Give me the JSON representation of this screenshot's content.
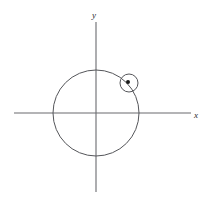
{
  "figure": {
    "type": "geometry-diagram",
    "title": "",
    "background_color": "#ffffff",
    "stroke_color": "#55565a",
    "axis_color": "#6a6b6f",
    "point_color": "#1a1a1a",
    "axes": {
      "x_axis": {
        "label": "x",
        "label_style": "italic",
        "origin_px": [
          96,
          113
        ],
        "start_px": [
          14,
          113
        ],
        "end_px": [
          191,
          113
        ]
      },
      "y_axis": {
        "label": "y",
        "label_style": "italic",
        "origin_px": [
          96,
          113
        ],
        "start_px": [
          96,
          192
        ],
        "end_px": [
          96,
          22
        ]
      }
    },
    "shapes": [
      {
        "name": "large-circle",
        "kind": "circle",
        "center_px": [
          96,
          113
        ],
        "radius_px": 43,
        "filled": false
      },
      {
        "name": "small-circle",
        "kind": "circle",
        "center_px": [
          129,
          83
        ],
        "radius_px": 9,
        "filled": false
      },
      {
        "name": "center-point",
        "kind": "point",
        "center_px": [
          128,
          82
        ],
        "radius_px": 2,
        "filled": true
      }
    ],
    "labels": {
      "y": "y",
      "x": "x"
    }
  },
  "chart_data": {
    "type": "scatter",
    "title": "",
    "xlabel": "x",
    "ylabel": "y",
    "grid": false,
    "legend": null,
    "xlim": [
      -1.9,
      2.2
    ],
    "ylim": [
      -1.8,
      2.1
    ],
    "curves": [
      {
        "name": "large circle",
        "equation": "x^2 + y^2 = 1",
        "center": [
          0,
          0
        ],
        "radius": 1
      },
      {
        "name": "small circle",
        "equation": "(x - 0.77)^2 + (y - 0.70)^2 = 0.21^2",
        "center": [
          0.77,
          0.7
        ],
        "radius": 0.21
      }
    ],
    "points": [
      {
        "name": "small circle center",
        "x": 0.74,
        "y": 0.72,
        "marker": "filled-dot"
      }
    ]
  }
}
